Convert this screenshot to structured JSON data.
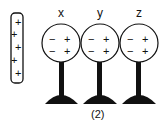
{
  "diagram": {
    "rod": {
      "charges": [
        "+",
        "+",
        "+",
        "+",
        "+"
      ]
    },
    "spheres": [
      {
        "label": "x",
        "left_charges": [
          "−",
          "−"
        ],
        "right_charges": [
          "+",
          "+"
        ]
      },
      {
        "label": "y",
        "left_charges": [
          "−",
          "−"
        ],
        "right_charges": [
          "+",
          "+"
        ]
      },
      {
        "label": "z",
        "left_charges": [
          "−",
          "−"
        ],
        "right_charges": [
          "+",
          "+"
        ]
      }
    ],
    "caption": "(2)",
    "colors": {
      "ink": "#111111",
      "background": "#ffffff"
    }
  }
}
